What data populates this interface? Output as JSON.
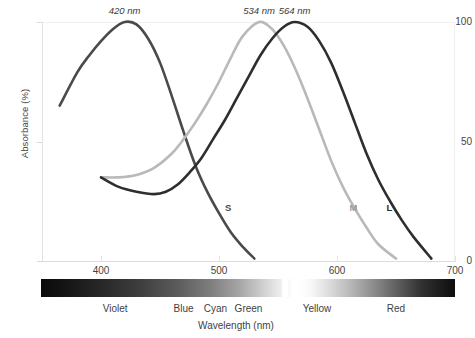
{
  "chart_data": {
    "type": "line",
    "title": "",
    "xlabel": "Wavelength (nm)",
    "ylabel": "Absorbance (%)",
    "xlim": [
      350,
      700
    ],
    "ylim": [
      0,
      100
    ],
    "grid": false,
    "legend_position": "inline-curve-labels",
    "xticks": [
      400,
      500,
      600,
      700
    ],
    "yticks": [
      0,
      50,
      100
    ],
    "annotations": [
      {
        "text": "420 nm",
        "x": 420,
        "y": 100,
        "italic": true
      },
      {
        "text": "534 nm",
        "x": 534,
        "y": 100,
        "italic": true
      },
      {
        "text": "564 nm",
        "x": 564,
        "y": 100,
        "italic": true
      }
    ],
    "series": [
      {
        "name": "S",
        "label": "S",
        "peak_nm": 420,
        "color": "#4a4a4a",
        "label_color": "#4a4a4a",
        "points": [
          {
            "x": 365,
            "y": 65
          },
          {
            "x": 380,
            "y": 79
          },
          {
            "x": 390,
            "y": 86
          },
          {
            "x": 400,
            "y": 92
          },
          {
            "x": 410,
            "y": 97
          },
          {
            "x": 420,
            "y": 100
          },
          {
            "x": 430,
            "y": 99
          },
          {
            "x": 440,
            "y": 93
          },
          {
            "x": 450,
            "y": 83
          },
          {
            "x": 460,
            "y": 69
          },
          {
            "x": 470,
            "y": 54
          },
          {
            "x": 480,
            "y": 40
          },
          {
            "x": 490,
            "y": 29
          },
          {
            "x": 500,
            "y": 20
          },
          {
            "x": 510,
            "y": 12
          },
          {
            "x": 520,
            "y": 6
          },
          {
            "x": 530,
            "y": 1
          }
        ]
      },
      {
        "name": "M",
        "label": "M",
        "peak_nm": 534,
        "color": "#b9b9b9",
        "label_color": "#9a9a9a",
        "points": [
          {
            "x": 400,
            "y": 35
          },
          {
            "x": 415,
            "y": 35
          },
          {
            "x": 430,
            "y": 36
          },
          {
            "x": 445,
            "y": 39
          },
          {
            "x": 460,
            "y": 45
          },
          {
            "x": 470,
            "y": 51
          },
          {
            "x": 480,
            "y": 58
          },
          {
            "x": 490,
            "y": 66
          },
          {
            "x": 500,
            "y": 75
          },
          {
            "x": 510,
            "y": 85
          },
          {
            "x": 520,
            "y": 94
          },
          {
            "x": 534,
            "y": 100
          },
          {
            "x": 545,
            "y": 97
          },
          {
            "x": 555,
            "y": 90
          },
          {
            "x": 565,
            "y": 80
          },
          {
            "x": 575,
            "y": 68
          },
          {
            "x": 585,
            "y": 55
          },
          {
            "x": 595,
            "y": 42
          },
          {
            "x": 605,
            "y": 31
          },
          {
            "x": 615,
            "y": 22
          },
          {
            "x": 625,
            "y": 14
          },
          {
            "x": 635,
            "y": 7
          },
          {
            "x": 650,
            "y": 1
          }
        ]
      },
      {
        "name": "L",
        "label": "L",
        "peak_nm": 564,
        "color": "#2e2e2e",
        "label_color": "#2e2e2e",
        "points": [
          {
            "x": 400,
            "y": 35
          },
          {
            "x": 415,
            "y": 31
          },
          {
            "x": 430,
            "y": 29
          },
          {
            "x": 445,
            "y": 28
          },
          {
            "x": 455,
            "y": 29
          },
          {
            "x": 465,
            "y": 32
          },
          {
            "x": 475,
            "y": 37
          },
          {
            "x": 485,
            "y": 43
          },
          {
            "x": 495,
            "y": 51
          },
          {
            "x": 505,
            "y": 59
          },
          {
            "x": 515,
            "y": 68
          },
          {
            "x": 525,
            "y": 77
          },
          {
            "x": 535,
            "y": 86
          },
          {
            "x": 545,
            "y": 93
          },
          {
            "x": 555,
            "y": 98
          },
          {
            "x": 564,
            "y": 100
          },
          {
            "x": 575,
            "y": 98
          },
          {
            "x": 585,
            "y": 92
          },
          {
            "x": 595,
            "y": 83
          },
          {
            "x": 605,
            "y": 71
          },
          {
            "x": 615,
            "y": 58
          },
          {
            "x": 625,
            "y": 45
          },
          {
            "x": 635,
            "y": 34
          },
          {
            "x": 645,
            "y": 25
          },
          {
            "x": 655,
            "y": 17
          },
          {
            "x": 665,
            "y": 10
          },
          {
            "x": 680,
            "y": 1
          }
        ]
      }
    ],
    "spectrum": {
      "description": "grayscale visible spectrum strip",
      "bands": [
        {
          "name": "Violet",
          "center_nm": 412
        },
        {
          "name": "Blue",
          "center_nm": 470
        },
        {
          "name": "Cyan",
          "center_nm": 497
        },
        {
          "name": "Green",
          "center_nm": 525
        },
        {
          "name": "Yellow",
          "center_nm": 583
        },
        {
          "name": "Red",
          "center_nm": 650
        }
      ]
    }
  },
  "axis": {
    "y_title": "Absorbance (%)",
    "x_title": "Wavelength (nm)",
    "y_tick_100": "100",
    "y_tick_50": "50",
    "y_tick_0": "0",
    "x_tick_400": "400",
    "x_tick_500": "500",
    "x_tick_600": "600",
    "x_tick_700": "700"
  },
  "peak_labels": {
    "s": "420 nm",
    "m": "534 nm",
    "l": "564 nm"
  },
  "curve_tags": {
    "s": "S",
    "m": "M",
    "l": "L"
  },
  "band_labels": {
    "violet": "Violet",
    "blue": "Blue",
    "cyan": "Cyan",
    "green": "Green",
    "yellow": "Yellow",
    "red": "Red"
  }
}
